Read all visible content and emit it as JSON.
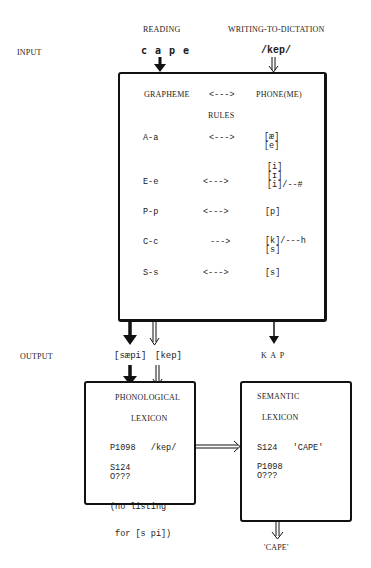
{
  "header": {
    "reading_label": "READING",
    "dictation_label": "WRITING-TO-DICTATION",
    "input_label": "INPUT",
    "input_grapheme": "c a p e",
    "input_phonemic": "/kep/"
  },
  "rules_box": {
    "col_left": "GRAPHEME",
    "col_arrow": "<--->",
    "col_right": "PHONE(ME)",
    "subtitle": "RULES",
    "rules": [
      {
        "grapheme": "A-a",
        "arrow": "<--->",
        "phones": [
          "[æ]",
          "[e]"
        ]
      },
      {
        "grapheme": "E-e",
        "arrow": "<--->",
        "phones": [
          "[i]",
          "[ɪ]",
          "[i]/--#"
        ]
      },
      {
        "grapheme": "P-p",
        "arrow": "<--->",
        "phones": [
          "[p]"
        ]
      },
      {
        "grapheme": "C-c",
        "arrow": "--->",
        "phones": [
          "[k]/---h",
          "[s]"
        ]
      },
      {
        "grapheme": "S-s",
        "arrow": "<--->",
        "phones": [
          "[s]"
        ]
      }
    ]
  },
  "output": {
    "output_label": "OUTPUT",
    "reading_output": "[sæpi]",
    "dictation_output": "[kep]",
    "spelling_output": "K A P"
  },
  "phonological_lexicon": {
    "title": "PHONOLOGICAL",
    "subtitle": "LEXICON",
    "entry_1": "P1098   /kep/",
    "entry_2": "S124",
    "entry_3": "O???",
    "note_1": "(no listing",
    "note_2": " for [s pi])"
  },
  "semantic_lexicon": {
    "title": "SEMANTIC",
    "subtitle": "LEXICON",
    "entry_1": "S124   'CAPE'",
    "entry_2": "P1098",
    "entry_3": "O???"
  },
  "final_output": "'CAPE'",
  "colors": {
    "ink": "#111111",
    "background": "#ffffff"
  }
}
